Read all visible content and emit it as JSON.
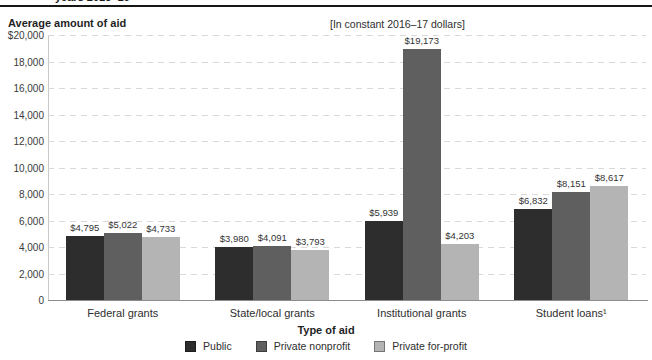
{
  "header": {
    "clipped_caption": "years 2015–16",
    "y_axis_title": "Average amount of aid",
    "note": "[In constant 2016–17 dollars]"
  },
  "chart_data": {
    "type": "bar",
    "categories": [
      "Federal grants",
      "State/local grants",
      "Institutional grants",
      "Student loans¹"
    ],
    "series": [
      {
        "name": "Public",
        "color": "#2e2d2e",
        "values": [
          4795,
          3980,
          5939,
          6832
        ]
      },
      {
        "name": "Private nonprofit",
        "color": "#605f60",
        "values": [
          5022,
          4091,
          19173,
          8151
        ]
      },
      {
        "name": "Private for-profit",
        "color": "#b5b4b5",
        "values": [
          4733,
          3793,
          4203,
          8617
        ]
      }
    ],
    "value_labels": [
      [
        "$4,795",
        "$5,022",
        "$4,733"
      ],
      [
        "$3,980",
        "$4,091",
        "$3,793"
      ],
      [
        "$5,939",
        "$19,173",
        "$4,203"
      ],
      [
        "$6,832",
        "$8,151",
        "$8,617"
      ]
    ],
    "xlabel": "Type of aid",
    "ylabel": "Average amount of aid",
    "ylim": [
      0,
      20000
    ],
    "ytick_step": 2000,
    "yticks": [
      "$20,000",
      "18,000",
      "16,000",
      "14,000",
      "12,000",
      "10,000",
      "8,000",
      "6,000",
      "4,000",
      "2,000",
      "0"
    ],
    "grid": "horizontal-dashed",
    "legend_position": "bottom"
  }
}
